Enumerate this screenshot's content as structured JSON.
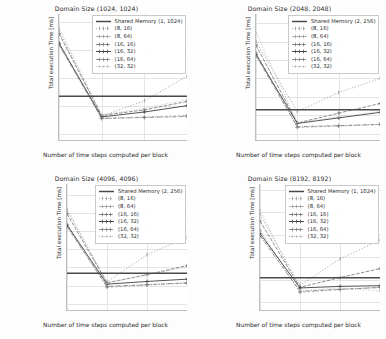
{
  "figure": {
    "background": "#fdfdfd",
    "axis_color": "#bdbdbd",
    "grid_color": "#e4e4e4",
    "text_color": "#2b2b2b",
    "xlabel": "Number of time steps computed per block",
    "ylabel": "Total execution Time [ms]",
    "xticks": [
      "1",
      "2",
      "3",
      "4"
    ]
  },
  "series_styles": [
    {
      "name": "shared-memory",
      "color": "#4a4a4a",
      "dash": "none",
      "marker": "none",
      "width": 1.5
    },
    {
      "name": "8-16",
      "color": "#8a8a8a",
      "dash": "1.2 1.8",
      "marker": "tick",
      "width": 0.7
    },
    {
      "name": "8-64",
      "color": "#9a9a9a",
      "dash": "2.5 1.8",
      "marker": "plus",
      "width": 0.7
    },
    {
      "name": "16-16",
      "color": "#6f6f6f",
      "dash": "3.5 1.5",
      "marker": "plus",
      "width": 0.8
    },
    {
      "name": "16-32",
      "color": "#3f3f3f",
      "dash": "none",
      "marker": "plus",
      "width": 0.9
    },
    {
      "name": "16-64",
      "color": "#7a7a7a",
      "dash": "4 1.2 1 1.2",
      "marker": "plus",
      "width": 0.8
    },
    {
      "name": "32-32",
      "color": "#b0b0b0",
      "dash": "1 1.6",
      "marker": "dot",
      "width": 0.8
    }
  ],
  "chart_data": [
    {
      "type": "line",
      "title": "Domain Size (1024, 1024)",
      "xlabel": "Number of time steps computed per block",
      "ylabel": "Total execution Time [ms]",
      "x": [
        1,
        2,
        3,
        4
      ],
      "xlim": [
        1,
        4
      ],
      "ylim": [
        760,
        1660
      ],
      "yticks": [
        800,
        1000,
        1200,
        1400,
        1600
      ],
      "ytick_labels": [
        "800",
        "1000",
        "1200",
        "1400",
        "1600"
      ],
      "grid": true,
      "legend_position": "upper right",
      "hline": {
        "label": "Shared Memory (1, 1024)",
        "value": 1072
      },
      "series": [
        {
          "name": "(8, 16)",
          "values": [
            1540,
            930,
            1040,
            1215
          ]
        },
        {
          "name": "(8, 64)",
          "values": [
            1455,
            912,
            925,
            935
          ]
        },
        {
          "name": "(16, 16)",
          "values": [
            1520,
            935,
            975,
            1035
          ]
        },
        {
          "name": "(16, 32)",
          "values": [
            1450,
            925,
            960,
            1005
          ]
        },
        {
          "name": "(16, 64)",
          "values": [
            1440,
            915,
            920,
            928
          ]
        },
        {
          "name": "(32, 32)",
          "values": [
            1565,
            940,
            985,
            1048
          ]
        }
      ]
    },
    {
      "type": "line",
      "title": "Domain Size (2048, 2048)",
      "xlabel": "Number of time steps computed per block",
      "ylabel": "Total execution Time [ms]",
      "x": [
        1,
        2,
        3,
        4
      ],
      "xlim": [
        1,
        4
      ],
      "ylim": [
        3330,
        6750
      ],
      "yticks": [
        3500,
        4000,
        4500,
        5000,
        5500,
        6000,
        6500
      ],
      "ytick_labels": [
        "3500",
        "4000",
        "4500",
        "5000",
        "5500",
        "6000",
        "6500"
      ],
      "grid": true,
      "legend_position": "upper right",
      "hline": {
        "label": "Shared Memory (2, 256)",
        "value": 4150
      },
      "series": [
        {
          "name": "(8, 16)",
          "values": [
            6000,
            4100,
            4620,
            5000
          ]
        },
        {
          "name": "(8, 64)",
          "values": [
            5700,
            3670,
            3710,
            3750
          ]
        },
        {
          "name": "(16, 16)",
          "values": [
            5900,
            3790,
            4060,
            4320
          ]
        },
        {
          "name": "(16, 32)",
          "values": [
            5650,
            3780,
            3930,
            4080
          ]
        },
        {
          "name": "(16, 64)",
          "values": [
            5620,
            3690,
            3720,
            3755
          ]
        },
        {
          "name": "(32, 32)",
          "values": [
            6250,
            3800,
            3960,
            4100
          ]
        }
      ]
    },
    {
      "type": "line",
      "title": "Domain Size (4096, 4096)",
      "xlabel": "Number of time steps computed per block",
      "ylabel": "Total execution Time [ms]",
      "x": [
        1,
        2,
        3,
        4
      ],
      "xlim": [
        1,
        4
      ],
      "ylim": [
        13300,
        27200
      ],
      "yticks": [
        14000,
        16000,
        18000,
        20000,
        22000,
        24000,
        26000
      ],
      "ytick_labels": [
        "14000",
        "16000",
        "18000",
        "20000",
        "22000",
        "24000",
        "26000"
      ],
      "grid": true,
      "legend_position": "upper right",
      "hline": {
        "label": "Shared Memory (2, 256)",
        "value": 17350
      },
      "series": [
        {
          "name": "(8, 16)",
          "values": [
            24300,
            16400,
            19400,
            21300
          ]
        },
        {
          "name": "(8, 64)",
          "values": [
            22600,
            15800,
            16050,
            16250
          ]
        },
        {
          "name": "(16, 16)",
          "values": [
            23900,
            16300,
            17200,
            18200
          ]
        },
        {
          "name": "(16, 32)",
          "values": [
            22700,
            16150,
            16450,
            16700
          ]
        },
        {
          "name": "(16, 64)",
          "values": [
            22500,
            15900,
            16100,
            16300
          ]
        },
        {
          "name": "(32, 32)",
          "values": [
            24500,
            16250,
            17150,
            18050
          ]
        }
      ]
    },
    {
      "type": "line",
      "title": "Domain Size (8192, 8192)",
      "xlabel": "Number of time steps computed per block",
      "ylabel": "Total execution Time [ms]",
      "x": [
        1,
        2,
        3,
        4
      ],
      "xlim": [
        1,
        4
      ],
      "ylim": [
        56500,
        112500
      ],
      "yticks": [
        60000,
        70000,
        80000,
        90000,
        100000,
        110000
      ],
      "ytick_labels": [
        "60000",
        "70000",
        "80000",
        "90000",
        "100000",
        "110000"
      ],
      "grid": true,
      "legend_position": "upper right",
      "hline": {
        "label": "Shared Memory (1, 1024)",
        "value": 70800
      },
      "series": [
        {
          "name": "(8, 16)",
          "values": [
            99000,
            67500,
            79200,
            87500
          ]
        },
        {
          "name": "(8, 64)",
          "values": [
            92000,
            64300,
            65600,
            66600
          ]
        },
        {
          "name": "(16, 16)",
          "values": [
            96000,
            66600,
            70900,
            74900
          ]
        },
        {
          "name": "(16, 32)",
          "values": [
            90500,
            66300,
            67000,
            67300
          ]
        },
        {
          "name": "(16, 64)",
          "values": [
            89500,
            64800,
            65700,
            66500
          ]
        },
        {
          "name": "(32, 32)",
          "values": [
            101000,
            65000,
            66300,
            64900
          ]
        }
      ]
    }
  ]
}
